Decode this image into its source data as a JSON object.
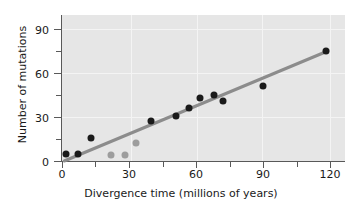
{
  "chart_data": {
    "type": "scatter",
    "title": "",
    "xlabel": "Divergence time (millions of years)",
    "ylabel": "Number of mutations",
    "xlim": [
      0,
      127
    ],
    "ylim": [
      0,
      100
    ],
    "xticks": [
      0,
      30,
      60,
      90,
      120
    ],
    "xticklabels": [
      "0",
      "30",
      "60",
      "90",
      "120"
    ],
    "x_minor_ticks": [
      15,
      45,
      75,
      105
    ],
    "yticks": [
      0,
      30,
      60,
      90
    ],
    "yticklabels": [
      "0",
      "30",
      "60",
      "90"
    ],
    "y_minor_ticks": [
      15,
      45,
      75
    ],
    "grid": true,
    "grid_color": "#f4f4f4",
    "panel_color": "#e6e6e6",
    "legend": null,
    "series": [
      {
        "name": "primary points",
        "marker": "filled-circle",
        "color": "#1a1a1a",
        "points": [
          {
            "x": 2,
            "y": 5
          },
          {
            "x": 7,
            "y": 5
          },
          {
            "x": 13,
            "y": 16
          },
          {
            "x": 40,
            "y": 27
          },
          {
            "x": 51,
            "y": 31
          },
          {
            "x": 57,
            "y": 36
          },
          {
            "x": 62,
            "y": 43
          },
          {
            "x": 68,
            "y": 45
          },
          {
            "x": 72,
            "y": 41
          },
          {
            "x": 90,
            "y": 51
          },
          {
            "x": 118,
            "y": 75
          }
        ]
      },
      {
        "name": "outlier points",
        "marker": "filled-circle",
        "color": "#9d9d9d",
        "points": [
          {
            "x": 22,
            "y": 4
          },
          {
            "x": 28,
            "y": 4
          },
          {
            "x": 33,
            "y": 12
          }
        ]
      }
    ],
    "trendline": {
      "name": "regression line",
      "color": "#8c8c8c",
      "width": 3,
      "x_start": 1,
      "y_start": 0,
      "x_end": 119,
      "y_end": 75
    }
  }
}
